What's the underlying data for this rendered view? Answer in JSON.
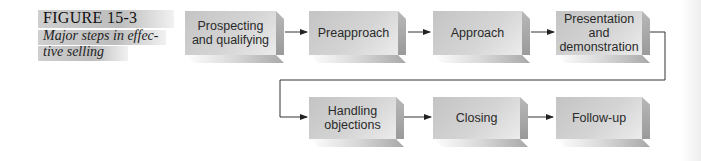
{
  "figure": {
    "label": "FIGURE 15-3",
    "caption_line1": "Major steps in effec-",
    "caption_line2": "tive selling"
  },
  "steps": [
    {
      "id": 1,
      "line1": "Prospecting",
      "line2": "and qualifying",
      "line3": ""
    },
    {
      "id": 2,
      "line1": "Preapproach",
      "line2": "",
      "line3": ""
    },
    {
      "id": 3,
      "line1": "Approach",
      "line2": "",
      "line3": ""
    },
    {
      "id": 4,
      "line1": "Presentation",
      "line2": "and",
      "line3": "demonstration"
    },
    {
      "id": 5,
      "line1": "Handling",
      "line2": "objections",
      "line3": ""
    },
    {
      "id": 6,
      "line1": "Closing",
      "line2": "",
      "line3": ""
    },
    {
      "id": 7,
      "line1": "Follow-up",
      "line2": "",
      "line3": ""
    }
  ],
  "flow": [
    "Prospecting and qualifying",
    "Preapproach",
    "Approach",
    "Presentation and demonstration",
    "Handling objections",
    "Closing",
    "Follow-up"
  ],
  "colors": {
    "box_face": "#d0d0d0",
    "box_side": "#a8a8a8",
    "arrow": "#222222"
  }
}
